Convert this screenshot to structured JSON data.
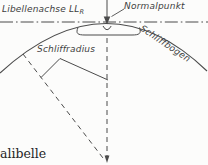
{
  "diagram": {
    "labels": {
      "axis_main": "Libellenachse LL",
      "axis_sub": "R",
      "normal_point": "Normalpunkt",
      "radius": "Schliffradius",
      "arc": "Schliffbogen"
    },
    "caption_fragment": "alibelle",
    "colors": {
      "stroke": "#4b4b4b",
      "label_text": "#3e3e3e",
      "caption_text": "#242424",
      "background": "#fcfcfb"
    }
  }
}
